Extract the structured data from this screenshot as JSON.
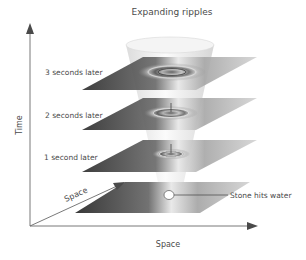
{
  "diagram": {
    "title": "Expanding ripples",
    "axes": {
      "vertical_label": "Time",
      "horizontal_label": "Space",
      "depth_label": "Space"
    },
    "slices": [
      {
        "label": "3 seconds later",
        "time_s": 3
      },
      {
        "label": "2 seconds later",
        "time_s": 2
      },
      {
        "label": "1 second later",
        "time_s": 1
      },
      {
        "label": "",
        "time_s": 0
      }
    ],
    "event_label": "Stone hits water",
    "colors": {
      "plane_dark": "#3a3a3a",
      "plane_light": "#c8c8c8",
      "cone": "#e6e6e6",
      "axis": "#6a6a6a",
      "text": "#4a4a4a"
    }
  }
}
